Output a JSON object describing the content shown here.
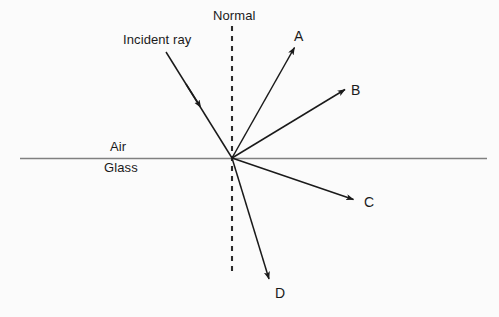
{
  "diagram": {
    "background_color": "#fbfbfb",
    "ink_color": "#1a1a1a",
    "interface_color": "#808080",
    "labels": {
      "normal": "Normal",
      "incident_ray": "Incident ray",
      "air": "Air",
      "glass": "Glass"
    },
    "ray_labels": {
      "a": "A",
      "b": "B",
      "c": "C",
      "d": "D"
    },
    "origin": {
      "x": 232,
      "y": 158
    },
    "interface_line": {
      "x1": 20,
      "y1": 158,
      "x2": 487,
      "y2": 158
    },
    "normal_line": {
      "x": 232,
      "y1": 26,
      "y2": 272,
      "style": "dashed"
    },
    "rays": [
      {
        "name": "incident-ray",
        "label": "Incident ray",
        "from": {
          "x": 166,
          "y": 52
        },
        "to": {
          "x": 232,
          "y": 158
        },
        "arrow": "midpoint",
        "arrow_at": {
          "x": 197,
          "y": 101
        },
        "direction": "toward-origin",
        "region": "air"
      },
      {
        "name": "ray-a",
        "label": "A",
        "from": {
          "x": 232,
          "y": 158
        },
        "to": {
          "x": 297,
          "y": 43
        },
        "arrow": "tip",
        "direction": "away-from-origin",
        "region": "air"
      },
      {
        "name": "ray-b",
        "label": "B",
        "from": {
          "x": 232,
          "y": 158
        },
        "to": {
          "x": 347,
          "y": 88
        },
        "arrow": "tip",
        "direction": "away-from-origin",
        "region": "air"
      },
      {
        "name": "ray-c",
        "label": "C",
        "from": {
          "x": 232,
          "y": 158
        },
        "to": {
          "x": 356,
          "y": 201
        },
        "arrow": "tip",
        "direction": "away-from-origin",
        "region": "glass"
      },
      {
        "name": "ray-d",
        "label": "D",
        "from": {
          "x": 232,
          "y": 158
        },
        "to": {
          "x": 271,
          "y": 283
        },
        "arrow": "tip",
        "direction": "away-from-origin",
        "region": "glass"
      }
    ]
  }
}
